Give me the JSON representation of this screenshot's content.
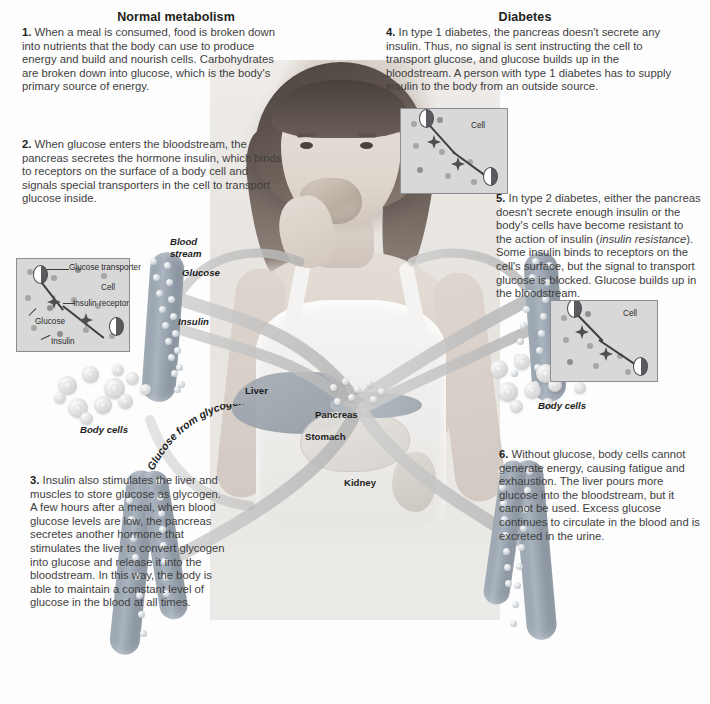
{
  "left_column": {
    "heading": "Normal metabolism",
    "step1": {
      "number": "1.",
      "text": "When a meal is consumed, food is broken down into nutrients that the body can use to produce energy and build and nourish cells. Carbohydrates are broken down into glucose, which is the body's primary source of energy."
    },
    "step2": {
      "number": "2.",
      "text": "When glucose enters the bloodstream, the pancreas secretes the hormone insulin, which binds to receptors on the surface of a body cell and signals special transporters in the cell to transport glucose inside."
    },
    "step3": {
      "number": "3.",
      "text": "Insulin also stimulates the liver and muscles to store glucose as glycogen. A few hours after a meal, when blood glucose levels are low, the pancreas secretes another hormone that stimulates the liver to convert glycogen into glucose and release it into the bloodstream. In this way, the body is able to maintain a constant level of glucose in the blood at all times."
    }
  },
  "right_column": {
    "heading": "Diabetes",
    "step4": {
      "number": "4.",
      "text": "In type 1 diabetes, the pancreas doesn't secrete any insulin. Thus, no signal is sent instructing the cell to transport glucose, and glucose builds up in the bloodstream. A person with type 1 diabetes has to supply insulin to the body from an outside source."
    },
    "step5": {
      "number": "5.",
      "text_before": "In type 2 diabetes, either the pancreas doesn't secrete enough insulin or the body's cells have become resistant to the action of insulin (",
      "italic": "insulin resistance",
      "text_after": "). Some insulin binds to receptors on the cell's surface, but the signal to transport glucose is blocked. Glucose builds up in the bloodstream."
    },
    "step6": {
      "number": "6.",
      "text": "Without glucose, body cells cannot generate energy, causing fatigue and exhaustion. The liver pours more glucose into the bloodstream, but it cannot be used. Excess glucose continues to circulate in the blood and is excreted in the urine."
    }
  },
  "insets": {
    "normal_cell": {
      "labels": {
        "glucose_transporter": "Glucose transporter",
        "cell": "Cell",
        "insulin_receptor": "Insulin receptor",
        "glucose": "Glucose",
        "insulin": "Insulin"
      }
    },
    "type1_cell": {
      "labels": {
        "cell": "Cell"
      }
    },
    "type2_cell": {
      "labels": {
        "cell": "Cell"
      }
    }
  },
  "anatomy_labels": {
    "blood_stream_line1": "Blood",
    "blood_stream_line2": "stream",
    "glucose": "Glucose",
    "insulin": "Insulin",
    "liver": "Liver",
    "pancreas": "Pancreas",
    "stomach": "Stomach",
    "kidney": "Kidney",
    "body_cells_left": "Body cells",
    "body_cells_right": "Body cells",
    "glucose_from_glycogen": "Glucose from glycogen"
  },
  "colors": {
    "text": "#3f3f3f",
    "heading": "#231f20",
    "inset_bg": "#d8d8d8",
    "inset_border": "#8c8c92",
    "vessel": "#8e9aa6",
    "receptor": "#4e4e52"
  }
}
